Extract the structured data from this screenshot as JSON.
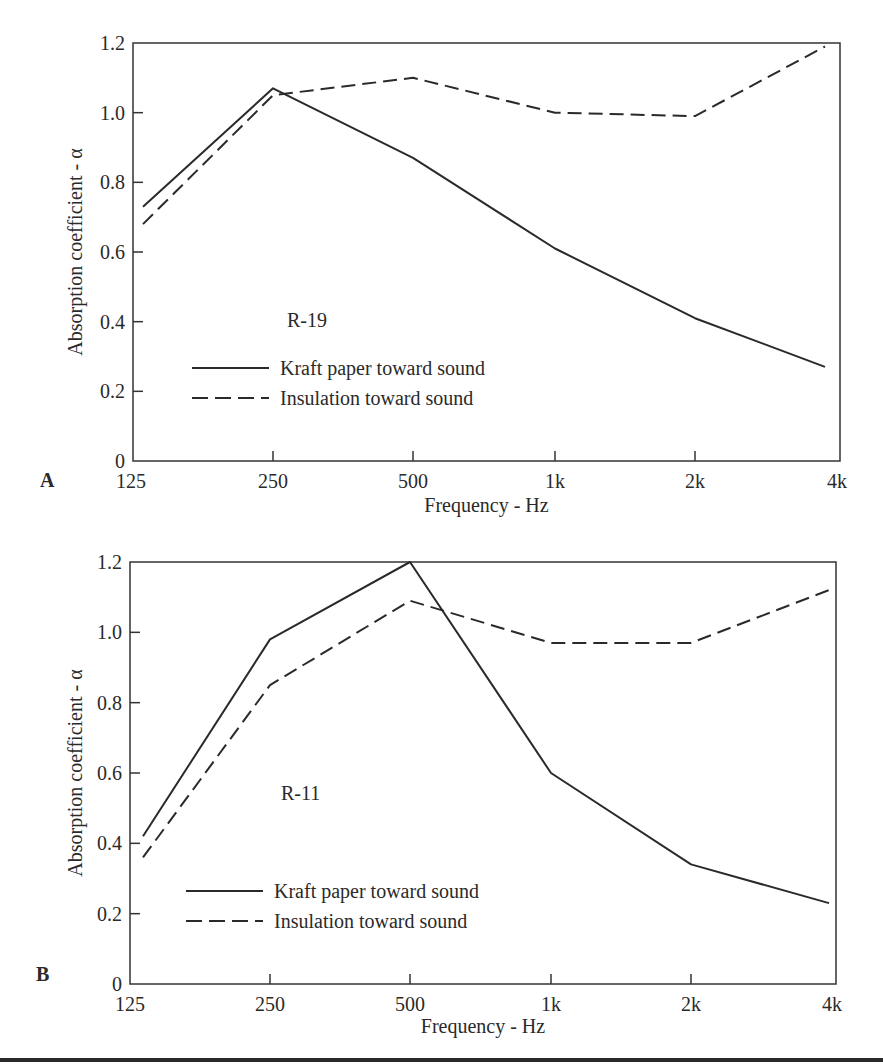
{
  "chart_data": [
    {
      "type": "line",
      "panel_label": "A",
      "annotation": "R-19",
      "title": "",
      "xlabel": "Frequency - Hz",
      "ylabel": "Absorption coefficient - α",
      "x_ticks": [
        "125",
        "250",
        "500",
        "1k",
        "2k",
        "4k"
      ],
      "y_ticks": [
        "0",
        "0.2",
        "0.4",
        "0.6",
        "0.8",
        "1.0",
        "1.2"
      ],
      "ylim": [
        0,
        1.2
      ],
      "x_scale": "log2",
      "categories": [
        125,
        250,
        500,
        1000,
        2000,
        4000
      ],
      "series": [
        {
          "name": "Kraft paper toward sound",
          "style": "solid",
          "values": [
            0.73,
            1.07,
            0.87,
            0.61,
            0.41,
            0.27
          ]
        },
        {
          "name": "Insulation toward sound",
          "style": "dashed",
          "values": [
            0.68,
            1.05,
            1.1,
            1.0,
            0.99,
            1.19
          ]
        }
      ],
      "legend_position": "lower-left",
      "grid": false
    },
    {
      "type": "line",
      "panel_label": "B",
      "annotation": "R-11",
      "title": "",
      "xlabel": "Frequency - Hz",
      "ylabel": "Absorption coefficient - α",
      "x_ticks": [
        "125",
        "250",
        "500",
        "1k",
        "2k",
        "4k"
      ],
      "y_ticks": [
        "0",
        "0.2",
        "0.4",
        "0.6",
        "0.8",
        "1.0",
        "1.2"
      ],
      "ylim": [
        0,
        1.2
      ],
      "x_scale": "log2",
      "categories": [
        125,
        250,
        500,
        1000,
        2000,
        4000
      ],
      "series": [
        {
          "name": "Kraft paper toward sound",
          "style": "solid",
          "values": [
            0.42,
            0.98,
            1.2,
            0.6,
            0.34,
            0.23
          ]
        },
        {
          "name": "Insulation toward sound",
          "style": "dashed",
          "values": [
            0.36,
            0.85,
            1.09,
            0.97,
            0.97,
            1.12
          ]
        }
      ],
      "legend_position": "lower-left",
      "grid": false
    }
  ]
}
